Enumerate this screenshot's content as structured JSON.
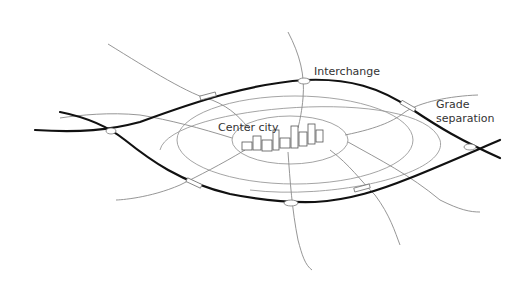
{
  "diagram": {
    "labels": {
      "center": "Center city",
      "interchange": "Interchange",
      "grade_line1": "Grade",
      "grade_line2": "separation"
    },
    "colors": {
      "background": "#ffffff",
      "major_road": "#111111",
      "minor_road": "#8a8a8a",
      "text": "#333333"
    }
  }
}
